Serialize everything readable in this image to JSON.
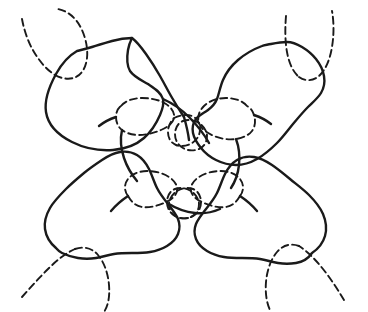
{
  "figure": {
    "title": "",
    "caption": "",
    "alt_description": "Hand-drawn line diagram: four solid-outlined lobed regions arranged around a central region containing four dashed bowtie loops, with four dashed leg-loops running off the edges at the corners",
    "background_color": "#ffffff",
    "stroke_color": "#1a1a1a",
    "frame_color": "#b5b5b5",
    "width": 368,
    "height": 312,
    "solid_stroke_width": 2.4,
    "dashed_stroke_width": 1.9,
    "dash_pattern": "7 4",
    "labels": []
  },
  "paths": {
    "blob_top_left": "M 77 51 C 70 55 62 63 56 74 C 50 85 44 99 46 112 C 48 125 58 135 72 142 C 86 149 100 151 113 150 C 126 149 136 145 144 138 C 152 131 157 122 160 115 C 163 108 164 103 163 99 C 161 92 154 88 148 84 C 141 80 134 77 130 71 C 126 64 127 56 128 50 C 129 44 131 40 132 38 C 127 38 119 39 112 41 C 105 43 98 45 92 47 C 86 49 81 50 77 51 Z",
    "blob_top_left_detail": "M 132 38 C 136 41 141 47 146 54 C 151 61 156 69 160 76 C 164 83 167 89 171 96 C 175 103 180 111 184 117",
    "blob_top_right": "M 262 46 C 254 49 245 54 238 60 C 231 66 226 73 223 80 C 220 87 219 94 217 99 C 215 104 212 107 208 110 C 204 113 199 115 196 119 C 193 123 192 128 193 133 C 194 138 197 143 201 148 C 205 153 210 157 216 160 C 222 163 229 165 236 165 C 243 165 250 163 257 159 C 264 155 271 149 277 143 C 283 137 288 130 293 124 C 298 118 303 112 308 107 C 313 102 318 98 321 93 C 324 88 325 82 324 76 C 323 70 320 64 316 59 C 312 54 307 50 302 47 C 297 44 292 42 287 42 C 282 42 276 43 271 44 C 266 45 264 45 262 46 Z",
    "blob_bottom_left": "M 56 248 C 50 243 46 236 45 229 C 44 222 46 215 50 208 C 54 201 60 195 66 189 C 72 183 78 178 84 173 C 90 168 96 164 102 160 C 108 156 114 153 120 152 C 126 151 132 152 137 155 C 142 158 146 163 149 169 C 152 175 154 182 157 188 C 160 194 164 199 168 204 C 172 209 176 214 178 219 C 180 224 180 229 178 234 C 176 239 172 243 167 246 C 162 249 156 251 150 252 C 144 253 138 253 132 253 C 126 253 120 253 114 254 C 108 255 102 257 96 258 C 90 259 84 259 78 258 C 72 257 66 255 62 253 C 58 251 57 249 56 248 Z",
    "blob_bottom_right": "M 312 253 C 318 249 323 243 325 236 C 327 229 326 221 323 214 C 320 207 315 201 309 195 C 303 189 296 184 290 179 C 284 174 278 169 272 165 C 266 161 260 158 254 157 C 248 156 242 157 237 160 C 232 163 228 168 225 174 C 222 180 220 187 217 193 C 214 199 210 204 206 209 C 202 214 198 219 196 224 C 194 229 194 234 196 239 C 198 244 202 248 207 251 C 212 254 218 256 224 257 C 230 258 236 258 242 258 C 248 258 254 258 260 259 C 266 260 272 262 278 263 C 284 264 290 264 296 263 C 302 262 308 259 312 253 Z",
    "bowtie_center_top_left": "M 121 106 C 125 101 133 98 142 98 C 151 98 160 100 166 104 C 172 108 175 113 174 118 C 173 123 168 127 161 130 C 154 133 146 135 139 135 C 132 135 126 133 122 130 C 118 127 116 122 116 117 C 116 112 118 108 121 106 Z",
    "bowtie_center_top_left_lobe2": "M 174 118 C 180 115 187 114 192 116 C 197 118 200 123 200 129 C 200 135 197 140 192 143 C 187 146 181 147 176 145 C 171 143 168 138 168 132 C 168 126 171 121 174 118 Z",
    "bowtie_center_top_right": "M 247 106 C 243 101 235 98 226 98 C 217 98 209 101 204 106 C 199 111 197 117 199 123 C 201 129 207 133 214 136 C 221 139 229 140 236 139 C 243 138 249 135 252 131 C 255 127 256 121 254 115 C 252 109 249 107 247 106 Z",
    "bowtie_center_top_right_lobe2": "M 199 123 C 194 120 188 119 183 121 C 178 123 175 128 175 134 C 175 140 178 145 183 148 C 188 151 194 151 199 149 C 204 147 207 142 207 136 C 207 130 202 125 199 123 Z",
    "bowtie_center_bottom_left": "M 128 196 C 124 191 124 184 128 179 C 132 174 139 171 147 171 C 155 171 163 173 169 177 C 175 181 178 186 177 191 C 176 196 171 200 164 203 C 157 206 149 208 142 207 C 135 206 131 201 128 196 Z",
    "bowtie_center_bottom_left_lobe2": "M 177 191 C 182 188 188 187 193 189 C 198 191 201 196 201 202 C 201 208 198 213 193 216 C 188 219 182 219 177 217 C 172 215 169 210 169 204 C 169 198 174 193 177 191 Z",
    "bowtie_center_bottom_right": "M 240 196 C 244 191 244 184 240 179 C 236 174 229 171 221 171 C 213 171 205 173 199 177 C 193 181 190 186 191 191 C 192 196 197 200 204 203 C 211 206 219 208 226 207 C 233 206 237 201 240 196 Z",
    "bowtie_center_bottom_right_lobe2": "M 191 191 C 186 188 180 187 175 189 C 170 191 167 196 167 202 C 167 208 170 213 175 216 C 180 219 186 219 191 217 C 196 215 199 210 199 204 C 199 198 194 193 191 191 Z",
    "leg_top_left_a": "M 22 19 C 24 30 28 42 34 52 C 40 62 47 70 55 75",
    "leg_top_left_b": "M 55 75 C 62 79 70 80 76 77 C 82 74 86 67 87 58 C 88 49 86 38 81 28 C 76 18 68 11 58 9",
    "leg_top_right_a": "M 286 16 C 285 28 285 41 287 52 C 289 63 293 72 299 77",
    "leg_top_right_b": "M 299 77 C 306 82 314 81 320 75 C 326 69 330 59 332 47 C 334 35 334 22 332 11",
    "leg_bottom_left_a": "M 22 297 C 30 288 39 278 48 269 C 57 260 66 253 75 249",
    "leg_bottom_left_b": "M 75 249 C 84 246 92 248 98 255 C 104 262 108 273 109 285 C 110 297 108 306 104 312",
    "leg_bottom_right_a": "M 344 300 C 338 290 331 279 323 269 C 315 259 307 251 299 246",
    "leg_bottom_right_b": "M 299 246 C 291 243 283 245 277 252 C 271 259 267 270 266 282 C 265 294 267 305 271 312",
    "connector_center_top": "M 184 117 C 186 124 188 132 189 140",
    "connector_left": "M 116 117 C 110 119 104 122 99 126",
    "connector_right": "M 254 115 C 260 117 266 120 271 124",
    "connector_bottom_left": "M 128 196 C 122 200 116 205 111 211",
    "connector_bottom_right": "M 240 196 C 246 200 252 205 257 211",
    "inner_ridge_top": "M 163 99 C 172 103 181 109 189 117 C 197 125 204 134 209 143",
    "inner_ridge_left_down": "M 122 130 C 120 139 121 149 124 158 C 127 167 132 175 137 181",
    "inner_ridge_right_down": "M 236 139 C 239 147 240 156 239 165 C 238 174 235 182 231 188",
    "inner_ridge_bottom": "M 169 204 C 177 209 186 212 195 213 C 204 214 213 212 220 209"
  },
  "strokes": {
    "solid_ids": [
      "blob_top_left",
      "blob_top_right",
      "blob_bottom_left",
      "blob_bottom_right",
      "blob_top_left_detail"
    ],
    "dashed_ids": [
      "bowtie_center_top_left",
      "bowtie_center_top_left_lobe2",
      "bowtie_center_top_right",
      "bowtie_center_top_right_lobe2",
      "bowtie_center_bottom_left",
      "bowtie_center_bottom_left_lobe2",
      "bowtie_center_bottom_right",
      "bowtie_center_bottom_right_lobe2",
      "leg_top_left_a",
      "leg_top_left_b",
      "leg_top_right_a",
      "leg_top_right_b",
      "leg_bottom_left_a",
      "leg_bottom_left_b",
      "leg_bottom_right_a",
      "leg_bottom_right_b"
    ]
  },
  "regions": [
    {
      "name": "top-left-lobe",
      "cx": 105,
      "cy": 95
    },
    {
      "name": "top-right-lobe",
      "cx": 265,
      "cy": 100
    },
    {
      "name": "bottom-left-lobe",
      "cx": 110,
      "cy": 205
    },
    {
      "name": "bottom-right-lobe",
      "cx": 258,
      "cy": 208
    },
    {
      "name": "center-region",
      "cx": 184,
      "cy": 155
    }
  ]
}
